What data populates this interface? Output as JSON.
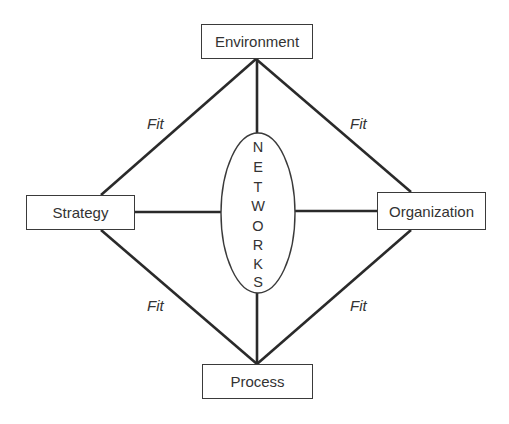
{
  "diagram": {
    "nodes": {
      "environment": "Environment",
      "strategy": "Strategy",
      "organization": "Organization",
      "process": "Process"
    },
    "center": {
      "label": "NETWORKS",
      "letters": [
        "N",
        "E",
        "T",
        "W",
        "O",
        "R",
        "K",
        "S"
      ]
    },
    "fit_labels": {
      "top_left": "Fit",
      "top_right": "Fit",
      "bottom_left": "Fit",
      "bottom_right": "Fit"
    },
    "colors": {
      "line": "#2a2a2a",
      "text": "#333333",
      "background": "#ffffff"
    }
  }
}
